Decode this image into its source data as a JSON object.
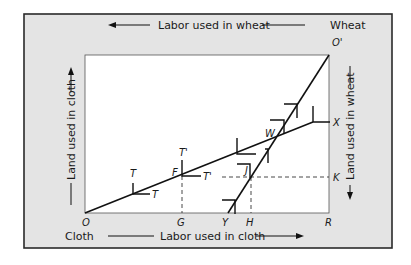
{
  "colors": {
    "frame_fill": "#e4e4e4",
    "frame_border": "#2a2a2a",
    "plot_fill": "#ffffff",
    "line": "#111111"
  },
  "axes": {
    "top_label": "Labor used in wheat",
    "bottom_label": "Labor used in cloth",
    "left_label": "Land used in cloth",
    "right_label": "Land used in wheat",
    "origin_cloth_label": "Cloth",
    "origin_wheat_label": "Wheat"
  },
  "points": {
    "O": "O",
    "O_prime": "O'",
    "R": "R",
    "G": "G",
    "Y": "Y",
    "H": "H",
    "K": "K",
    "X": "X",
    "W": "W",
    "F": "F",
    "J": "J",
    "T1": "T",
    "T2": "T",
    "T_prime_1": "T'",
    "T_prime_2": "T'"
  },
  "icons": {
    "arrow_left": "arrow-left",
    "arrow_right": "arrow-right",
    "arrow_up": "arrow-up",
    "arrow_down": "arrow-down"
  }
}
